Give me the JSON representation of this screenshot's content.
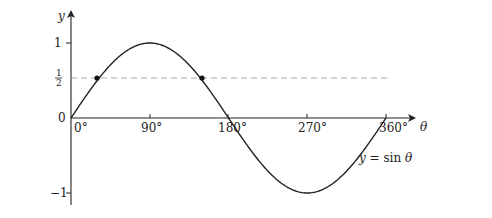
{
  "chart_data": {
    "type": "line",
    "title": "",
    "xlabel": "θ",
    "ylabel": "y",
    "xlim": [
      0,
      360
    ],
    "ylim": [
      -1,
      1
    ],
    "grid": false,
    "x_ticks": [
      {
        "value": 0,
        "label": "0°"
      },
      {
        "value": 90,
        "label": "90°"
      },
      {
        "value": 180,
        "label": "180°"
      },
      {
        "value": 270,
        "label": "270°"
      },
      {
        "value": 360,
        "label": "360°"
      }
    ],
    "y_ticks": [
      {
        "value": 1,
        "label": "1"
      },
      {
        "value": 0.5,
        "label": "½"
      },
      {
        "value": 0,
        "label": "0"
      },
      {
        "value": -1,
        "label": "−1"
      }
    ],
    "series": [
      {
        "name": "y = sin θ",
        "function": "sin",
        "x": [
          0,
          30,
          60,
          90,
          120,
          150,
          180,
          210,
          240,
          270,
          300,
          330,
          360
        ],
        "values": [
          0,
          0.5,
          0.866,
          1,
          0.866,
          0.5,
          0,
          -0.5,
          -0.866,
          -1,
          -0.866,
          -0.5,
          0
        ]
      }
    ],
    "reference_lines": [
      {
        "type": "horizontal",
        "y": 0.5,
        "style": "dashed",
        "x_range": [
          0,
          360
        ]
      }
    ],
    "marked_points": [
      {
        "x": 30,
        "y": 0.5
      },
      {
        "x": 150,
        "y": 0.5
      }
    ],
    "annotations": [
      {
        "text": "y = sin θ",
        "near_x": 330,
        "near_y": -0.55
      }
    ]
  },
  "labels": {
    "y_axis": "y",
    "x_axis": "θ",
    "y_one": "1",
    "y_half_num": "1",
    "y_half_den": "2",
    "y_zero": "0",
    "y_minus_one": "−1",
    "x_0": "0°",
    "x_90": "90°",
    "x_180": "180°",
    "x_270": "270°",
    "x_360": "360°",
    "curve_label_y": "y",
    "curve_label_eq": " = sin ",
    "curve_label_theta": "θ"
  }
}
